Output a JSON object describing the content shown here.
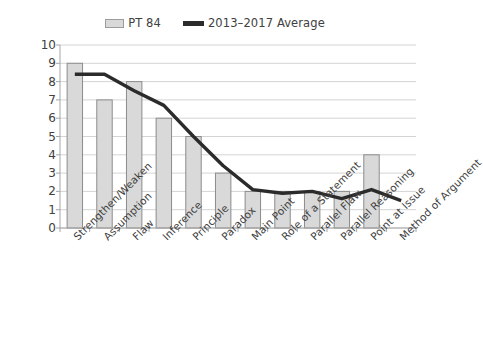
{
  "legend": {
    "entries": [
      {
        "label": "PT 84",
        "type": "bar",
        "color": "#d9d9d9",
        "icon": "bar-swatch-icon"
      },
      {
        "label": "2013–2017 Average",
        "type": "line",
        "color": "#2b2b2b",
        "icon": "line-swatch-icon"
      }
    ]
  },
  "axis": {
    "y_ticks": [
      "0",
      "1",
      "2",
      "3",
      "4",
      "5",
      "6",
      "7",
      "8",
      "9",
      "10"
    ]
  },
  "colors": {
    "bar_fill": "#d9d9d9",
    "bar_stroke": "#8c8c8c",
    "line": "#2b2b2b",
    "gridline": "#d4d4d4",
    "axis": "#a6a6a6",
    "text": "#404040"
  },
  "chart_data": {
    "type": "bar",
    "title": "",
    "subtitle": "",
    "xlabel": "",
    "ylabel": "",
    "ylim": [
      0,
      10
    ],
    "ytick_step": 1,
    "grid": true,
    "legend_position": "top-center",
    "categories": [
      "Strengthen/Weaken",
      "Assumption",
      "Flaw",
      "Inference",
      "Principle",
      "Paradox",
      "Main Point",
      "Role of a Statement",
      "Parallel Flaw",
      "Parallel Reasoning",
      "Point at Issue",
      "Method of Argument"
    ],
    "series": [
      {
        "name": "PT 84",
        "type": "bar",
        "values": [
          9,
          7,
          8,
          6,
          5,
          3,
          2,
          2,
          2,
          2,
          4,
          0
        ]
      },
      {
        "name": "2013–2017 Average",
        "type": "line",
        "values": [
          8.4,
          8.4,
          7.5,
          6.7,
          5.0,
          3.4,
          2.1,
          1.9,
          2.0,
          1.6,
          2.1,
          1.5
        ]
      }
    ]
  }
}
